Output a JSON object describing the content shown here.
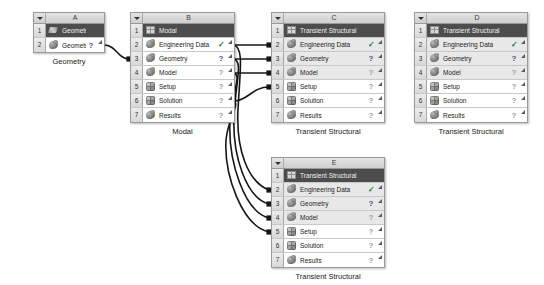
{
  "app": {
    "view_name": "Project Schematic",
    "background_color": "#ffffff"
  },
  "colors": {
    "title_row_bg": "#4d4d4d",
    "header_bg": "#d8d8d8",
    "row_shade_bg": "#e8e8e8",
    "border": "#9a9a9a",
    "check_green": "#2f6f2f",
    "question_blue": "#4d4d8a",
    "question_dim": "#9a9ab5",
    "link_color": "#161616"
  },
  "status_glyphs": {
    "check": "✓",
    "question": "?",
    "question_dim": "?"
  },
  "systems": [
    {
      "id": "A",
      "letter": "A",
      "caption": "Geometry",
      "left": 33,
      "top": 12,
      "width": 72,
      "rows": [
        {
          "num": "1",
          "label": "Geometry",
          "icon": "geometry-sketch-icon",
          "status": "none",
          "title": true,
          "shaded": false,
          "corner": false
        },
        {
          "num": "2",
          "label": "Geometry",
          "icon": "geometry-icon",
          "status": "question",
          "title": false,
          "shaded": false,
          "corner": true
        }
      ]
    },
    {
      "id": "B",
      "letter": "B",
      "caption": "Modal",
      "left": 130,
      "top": 12,
      "width": 105,
      "rows": [
        {
          "num": "1",
          "label": "Modal",
          "icon": "modal-system-icon",
          "status": "none",
          "title": true,
          "shaded": false,
          "corner": false
        },
        {
          "num": "2",
          "label": "Engineering Data",
          "icon": "engineering-data-icon",
          "status": "check",
          "title": false,
          "shaded": false,
          "corner": true
        },
        {
          "num": "3",
          "label": "Geometry",
          "icon": "geometry-icon",
          "status": "question",
          "title": false,
          "shaded": false,
          "corner": true
        },
        {
          "num": "4",
          "label": "Model",
          "icon": "model-icon",
          "status": "question_dim",
          "title": false,
          "shaded": false,
          "corner": true
        },
        {
          "num": "5",
          "label": "Setup",
          "icon": "setup-icon",
          "status": "question_dim",
          "title": false,
          "shaded": false,
          "corner": true
        },
        {
          "num": "6",
          "label": "Solution",
          "icon": "solution-icon",
          "status": "question_dim",
          "title": false,
          "shaded": false,
          "corner": true
        },
        {
          "num": "7",
          "label": "Results",
          "icon": "results-icon",
          "status": "question_dim",
          "title": false,
          "shaded": false,
          "corner": true
        }
      ]
    },
    {
      "id": "C",
      "letter": "C",
      "caption": "Transient Structural",
      "left": 271,
      "top": 12,
      "width": 114,
      "rows": [
        {
          "num": "1",
          "label": "Transient Structural",
          "icon": "transient-structural-system-icon",
          "status": "none",
          "title": true,
          "shaded": false,
          "corner": false
        },
        {
          "num": "2",
          "label": "Engineering Data",
          "icon": "engineering-data-icon",
          "status": "check",
          "title": false,
          "shaded": true,
          "corner": true
        },
        {
          "num": "3",
          "label": "Geometry",
          "icon": "geometry-icon",
          "status": "question",
          "title": false,
          "shaded": true,
          "corner": true
        },
        {
          "num": "4",
          "label": "Model",
          "icon": "model-icon",
          "status": "question_dim",
          "title": false,
          "shaded": true,
          "corner": true
        },
        {
          "num": "5",
          "label": "Setup",
          "icon": "setup-icon",
          "status": "question_dim",
          "title": false,
          "shaded": false,
          "corner": true
        },
        {
          "num": "6",
          "label": "Solution",
          "icon": "solution-icon",
          "status": "question_dim",
          "title": false,
          "shaded": false,
          "corner": true
        },
        {
          "num": "7",
          "label": "Results",
          "icon": "results-icon",
          "status": "question_dim",
          "title": false,
          "shaded": false,
          "corner": true
        }
      ]
    },
    {
      "id": "D",
      "letter": "D",
      "caption": "Transient Structural",
      "left": 414,
      "top": 12,
      "width": 114,
      "rows": [
        {
          "num": "1",
          "label": "Transient Structural",
          "icon": "transient-structural-system-icon",
          "status": "none",
          "title": true,
          "shaded": false,
          "corner": false
        },
        {
          "num": "2",
          "label": "Engineering Data",
          "icon": "engineering-data-icon",
          "status": "check",
          "title": false,
          "shaded": true,
          "corner": true
        },
        {
          "num": "3",
          "label": "Geometry",
          "icon": "geometry-icon",
          "status": "question",
          "title": false,
          "shaded": true,
          "corner": true
        },
        {
          "num": "4",
          "label": "Model",
          "icon": "model-icon",
          "status": "question_dim",
          "title": false,
          "shaded": true,
          "corner": true
        },
        {
          "num": "5",
          "label": "Setup",
          "icon": "setup-icon",
          "status": "question_dim",
          "title": false,
          "shaded": false,
          "corner": true
        },
        {
          "num": "6",
          "label": "Solution",
          "icon": "solution-icon",
          "status": "question_dim",
          "title": false,
          "shaded": false,
          "corner": true
        },
        {
          "num": "7",
          "label": "Results",
          "icon": "results-icon",
          "status": "question_dim",
          "title": false,
          "shaded": false,
          "corner": true
        }
      ]
    },
    {
      "id": "E",
      "letter": "E",
      "caption": "Transient Structural",
      "left": 271,
      "top": 157,
      "width": 114,
      "rows": [
        {
          "num": "1",
          "label": "Transient Structural",
          "icon": "transient-structural-system-icon",
          "status": "none",
          "title": true,
          "shaded": false,
          "corner": false
        },
        {
          "num": "2",
          "label": "Engineering Data",
          "icon": "engineering-data-icon",
          "status": "check",
          "title": false,
          "shaded": true,
          "corner": true
        },
        {
          "num": "3",
          "label": "Geometry",
          "icon": "geometry-icon",
          "status": "question",
          "title": false,
          "shaded": true,
          "corner": true
        },
        {
          "num": "4",
          "label": "Model",
          "icon": "model-icon",
          "status": "question_dim",
          "title": false,
          "shaded": true,
          "corner": true
        },
        {
          "num": "5",
          "label": "Setup",
          "icon": "setup-icon",
          "status": "question_dim",
          "title": false,
          "shaded": false,
          "corner": true
        },
        {
          "num": "6",
          "label": "Solution",
          "icon": "solution-icon",
          "status": "question_dim",
          "title": false,
          "shaded": false,
          "corner": true
        },
        {
          "num": "7",
          "label": "Results",
          "icon": "results-icon",
          "status": "question_dim",
          "title": false,
          "shaded": false,
          "corner": true
        }
      ]
    }
  ],
  "links": [
    {
      "id": "A2-B3",
      "from": "A.2",
      "to": "B.3",
      "path": "M 104,45 C 116,45 118,59 129,59"
    },
    {
      "id": "B2-C2",
      "from": "B.2",
      "to": "C.2",
      "path": "M 234,45 C 250,45 254,45 269,45"
    },
    {
      "id": "B3-C3",
      "from": "B.3",
      "to": "C.3",
      "path": "M 234,59 C 250,59 254,59 269,59"
    },
    {
      "id": "B4-C4",
      "from": "B.4",
      "to": "C.4",
      "path": "M 234,73 C 250,73 254,73 269,73"
    },
    {
      "id": "B6-C5",
      "from": "B.6",
      "to": "C.5",
      "path": "M 234,101 C 248,101 252,87 269,87"
    },
    {
      "id": "B2-E2",
      "from": "B.2",
      "to": "E.2",
      "path": "M 234,45 C 244,48 240,70 238,110 C 236,150 248,182 269,190"
    },
    {
      "id": "B3-E3",
      "from": "B.3",
      "to": "E.3",
      "path": "M 234,59 C 243,62 236,80 234,115 C 232,155 246,198 269,204"
    },
    {
      "id": "B4-E4",
      "from": "B.4",
      "to": "E.4",
      "path": "M 234,73 C 242,76 232,92 230,122 C 228,160 244,212 269,218"
    },
    {
      "id": "B6-E5",
      "from": "B.6",
      "to": "E.5",
      "path": "M 234,101 C 240,104 228,118 226,140 C 224,175 242,226 269,232"
    }
  ]
}
